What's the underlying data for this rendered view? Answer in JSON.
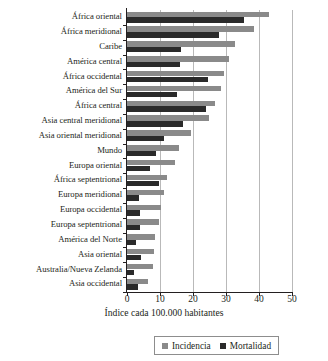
{
  "chart_data": {
    "type": "bar",
    "orientation": "horizontal",
    "title": "",
    "xlabel": "Índice cada 100.000 habitantes",
    "ylabel": "",
    "xlim": [
      0,
      50
    ],
    "xticks": [
      0,
      10,
      20,
      30,
      40,
      50
    ],
    "grid": true,
    "legend_position": "bottom",
    "categories": [
      "África oriental",
      "África meridional",
      "Caribe",
      "América central",
      "África occidental",
      "América del Sur",
      "África central",
      "Asia central meridional",
      "Asia oriental meridional",
      "Mundo",
      "Europa oriental",
      "África septentrional",
      "Europa meridional",
      "Europa occidental",
      "Europa septentrional",
      "América del Norte",
      "Asia oriental",
      "Australia/Nueva Zelanda",
      "Asia occidental"
    ],
    "series": [
      {
        "name": "Incidencia",
        "color": "#8a8a8a",
        "values": [
          43.0,
          38.5,
          32.6,
          31.0,
          29.3,
          28.6,
          26.6,
          24.8,
          19.3,
          15.8,
          14.4,
          12.2,
          11.1,
          10.3,
          9.8,
          8.5,
          8.1,
          8.0,
          6.4
        ]
      },
      {
        "name": "Mortalidad",
        "color": "#2a2a2a",
        "values": [
          35.4,
          27.8,
          16.5,
          16.0,
          24.4,
          15.3,
          24.0,
          17.0,
          11.3,
          8.9,
          7.0,
          9.8,
          3.5,
          3.8,
          4.0,
          2.7,
          4.2,
          2.0,
          3.3
        ]
      }
    ]
  },
  "axis": {
    "title": "Índice cada 100.000 habitantes",
    "tick_labels": [
      "0",
      "10",
      "20",
      "30",
      "40",
      "50"
    ]
  },
  "legend": {
    "items": [
      {
        "label": "Incidencia",
        "color": "#8a8a8a"
      },
      {
        "label": "Mortalidad",
        "color": "#2a2a2a"
      }
    ]
  }
}
